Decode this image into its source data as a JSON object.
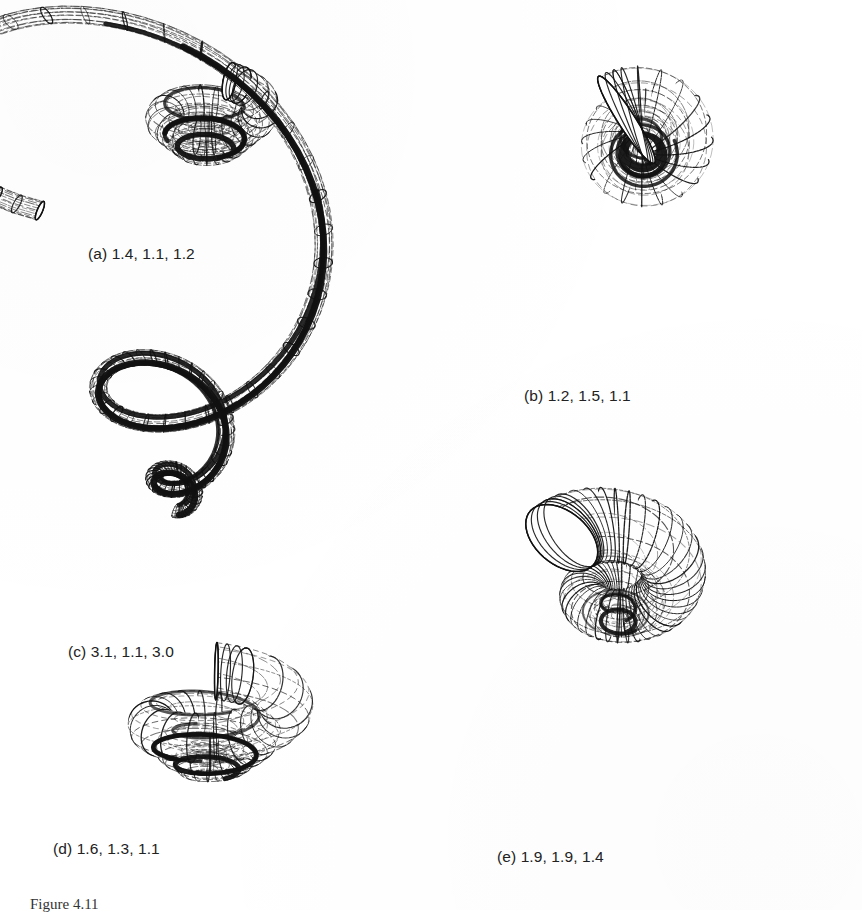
{
  "figure": {
    "label": "Figure 4.11",
    "background_color": "#ffffff",
    "ink_color": "#111111"
  },
  "panels": [
    {
      "id": "a",
      "caption": "(a) 1.4, 1.1, 1.2",
      "letter": "(a)",
      "params": [
        1.4,
        1.1,
        1.2
      ],
      "whorl_expansion": 1.4,
      "tube_expansion": 1.1,
      "translation": 1.2,
      "whorls": 3.1,
      "view": "lateral-flat",
      "shape": "low-spired depressed shell with wide aperture"
    },
    {
      "id": "b",
      "caption": "(b) 1.2, 1.5, 1.1",
      "letter": "(b)",
      "params": [
        1.2,
        1.5,
        1.1
      ],
      "whorl_expansion": 1.2,
      "tube_expansion": 1.5,
      "translation": 1.1,
      "whorls": 3.4,
      "view": "lateral-tall",
      "shape": "high-spired turreted shell"
    },
    {
      "id": "c",
      "caption": "(c) 3.1, 1.1, 3.0",
      "letter": "(c)",
      "params": [
        3.1,
        1.1,
        3.0
      ],
      "whorl_expansion": 3.1,
      "tube_expansion": 1.1,
      "translation": 3.0,
      "whorls": 3.0,
      "view": "apertural",
      "shape": "rapidly expanding shell dominated by a single large body whorl"
    },
    {
      "id": "d",
      "caption": "(d) 1.6, 1.3, 1.1",
      "letter": "(d)",
      "params": [
        1.6,
        1.3,
        1.1
      ],
      "whorl_expansion": 1.6,
      "tube_expansion": 1.3,
      "translation": 1.1,
      "whorls": 3.2,
      "view": "lateral-flat",
      "shape": "flattened shell with long extended body whorl"
    },
    {
      "id": "e",
      "caption": "(e) 1.9, 1.9, 1.4",
      "letter": "(e)",
      "params": [
        1.9,
        1.9,
        1.4
      ],
      "whorl_expansion": 1.9,
      "tube_expansion": 1.9,
      "translation": 1.4,
      "whorls": 2.6,
      "view": "oblique",
      "shape": "loosely coiled open helical tube"
    }
  ]
}
